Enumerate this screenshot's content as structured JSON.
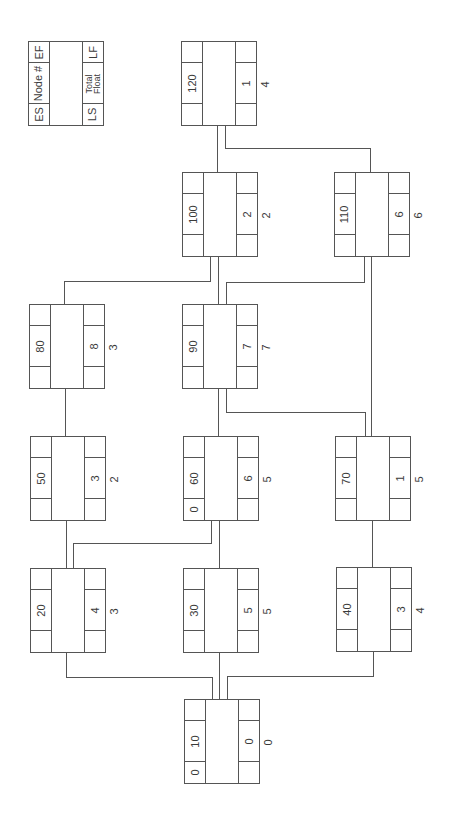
{
  "legend": {
    "es": "ES",
    "node_num": "Node #",
    "ef": "EF",
    "ls": "LS",
    "total_float": "Total Float",
    "lf": "LF"
  },
  "nodes": {
    "n10": {
      "id": "10",
      "es": "0",
      "ef": "",
      "ls": "",
      "tf": "0",
      "lf": "",
      "float": "0"
    },
    "n20": {
      "id": "20",
      "es": "",
      "ef": "",
      "ls": "",
      "tf": "4",
      "lf": "",
      "float": "3"
    },
    "n30": {
      "id": "30",
      "es": "",
      "ef": "",
      "ls": "",
      "tf": "5",
      "lf": "",
      "float": "5"
    },
    "n40": {
      "id": "40",
      "es": "",
      "ef": "",
      "ls": "",
      "tf": "3",
      "lf": "",
      "float": "4"
    },
    "n50": {
      "id": "50",
      "es": "",
      "ef": "",
      "ls": "",
      "tf": "3",
      "lf": "",
      "float": "2"
    },
    "n60": {
      "id": "60",
      "es": "0",
      "ef": "",
      "ls": "",
      "tf": "6",
      "lf": "",
      "float": "5"
    },
    "n70": {
      "id": "70",
      "es": "",
      "ef": "",
      "ls": "",
      "tf": "1",
      "lf": "",
      "float": "5"
    },
    "n80": {
      "id": "80",
      "es": "",
      "ef": "",
      "ls": "",
      "tf": "8",
      "lf": "",
      "float": "3"
    },
    "n90": {
      "id": "90",
      "es": "",
      "ef": "",
      "ls": "",
      "tf": "7",
      "lf": "",
      "float": "7"
    },
    "n100": {
      "id": "100",
      "es": "",
      "ef": "",
      "ls": "",
      "tf": "2",
      "lf": "",
      "float": "2"
    },
    "n110": {
      "id": "110",
      "es": "",
      "ef": "",
      "ls": "",
      "tf": "6",
      "lf": "",
      "float": "6"
    },
    "n120": {
      "id": "120",
      "es": "",
      "ef": "",
      "ls": "",
      "tf": "1",
      "lf": "",
      "float": "4"
    }
  },
  "edges": [
    [
      "10",
      "20"
    ],
    [
      "10",
      "30"
    ],
    [
      "10",
      "40"
    ],
    [
      "20",
      "50"
    ],
    [
      "20",
      "60"
    ],
    [
      "30",
      "60"
    ],
    [
      "40",
      "70"
    ],
    [
      "50",
      "80"
    ],
    [
      "60",
      "90"
    ],
    [
      "70",
      "90"
    ],
    [
      "70",
      "110"
    ],
    [
      "80",
      "100"
    ],
    [
      "90",
      "100"
    ],
    [
      "90",
      "110"
    ],
    [
      "100",
      "120"
    ],
    [
      "110",
      "120"
    ]
  ],
  "colors": {
    "line": "#555555",
    "text": "#3a3a3a",
    "background": "#ffffff"
  }
}
